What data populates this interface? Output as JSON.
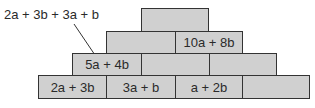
{
  "diagram": {
    "type": "number-pyramid",
    "annotation": {
      "text": "2a + 3b + 3a + b",
      "points_to": "row3.brick0"
    },
    "rows": [
      {
        "name": "row1-top",
        "bricks": [
          ""
        ]
      },
      {
        "name": "row2",
        "bricks": [
          "",
          "10a + 8b"
        ]
      },
      {
        "name": "row3",
        "bricks": [
          "5a + 4b",
          "",
          ""
        ]
      },
      {
        "name": "row4-bottom",
        "bricks": [
          "2a + 3b",
          "3a + b",
          "a + 2b",
          ""
        ]
      }
    ],
    "colors": {
      "brick_fill": "#d0d0d0",
      "brick_border": "#333333",
      "text": "#2a2a2a"
    }
  }
}
